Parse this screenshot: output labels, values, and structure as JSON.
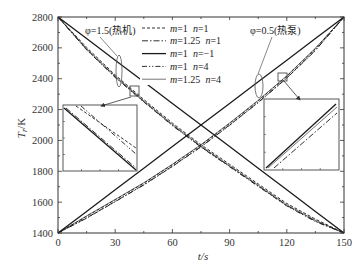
{
  "chart_data": {
    "type": "line",
    "title": "",
    "xlabel": "t/s",
    "ylabel": "T_r/K",
    "xlim": [
      0,
      150
    ],
    "ylim": [
      1400,
      2800
    ],
    "xticks": [
      0,
      30,
      60,
      90,
      120,
      150
    ],
    "yticks": [
      1400,
      1600,
      1800,
      2000,
      2200,
      2400,
      2600,
      2800
    ],
    "grid": false,
    "legend_position": "upper center",
    "x": [
      0,
      15,
      30,
      45,
      60,
      75,
      90,
      105,
      120,
      135,
      150
    ],
    "series": [
      {
        "name": "m=1 n=1",
        "group": "heat-engine phi=1.5",
        "style": "dashed",
        "values": [
          2800,
          2603,
          2424,
          2265,
          2112,
          1972,
          1845,
          1718,
          1591,
          1490,
          1400
        ]
      },
      {
        "name": "m=1.25 n=1",
        "group": "heat-engine phi=1.5",
        "style": "dash-dot",
        "values": [
          2800,
          2590,
          2411,
          2252,
          2099,
          1959,
          1832,
          1705,
          1578,
          1477,
          1400
        ]
      },
      {
        "name": "m=1 n=-1",
        "group": "heat-engine phi=1.5",
        "style": "solid",
        "values": [
          2800,
          2660,
          2520,
          2380,
          2240,
          2100,
          1960,
          1820,
          1680,
          1540,
          1400
        ]
      },
      {
        "name": "m=1 n=4",
        "group": "heat-engine phi=1.5",
        "style": "dash-dot-dot",
        "values": [
          2800,
          2587,
          2408,
          2249,
          2096,
          1956,
          1829,
          1702,
          1575,
          1474,
          1400
        ]
      },
      {
        "name": "m=1.25 n=4",
        "group": "heat-engine phi=1.5",
        "style": "thin-solid",
        "values": [
          2800,
          2595,
          2416,
          2257,
          2104,
          1964,
          1837,
          1710,
          1583,
          1482,
          1400
        ]
      },
      {
        "name": "m=1 n=1",
        "group": "heat-pump phi=0.5",
        "style": "dashed",
        "values": [
          1400,
          1508,
          1615,
          1723,
          1843,
          1970,
          2110,
          2257,
          2416,
          2595,
          2800
        ]
      },
      {
        "name": "m=1.25 n=1",
        "group": "heat-pump phi=0.5",
        "style": "dash-dot",
        "values": [
          1400,
          1498,
          1605,
          1713,
          1833,
          1960,
          2100,
          2247,
          2406,
          2585,
          2800
        ]
      },
      {
        "name": "m=1 n=-1",
        "group": "heat-pump phi=0.5",
        "style": "solid",
        "values": [
          1400,
          1540,
          1680,
          1820,
          1960,
          2100,
          2240,
          2380,
          2520,
          2660,
          2800
        ]
      },
      {
        "name": "m=1 n=4",
        "group": "heat-pump phi=0.5",
        "style": "dash-dot-dot",
        "values": [
          1400,
          1496,
          1603,
          1711,
          1831,
          1958,
          2098,
          2245,
          2404,
          2583,
          2800
        ]
      },
      {
        "name": "m=1.25 n=4",
        "group": "heat-pump phi=0.5",
        "style": "thin-solid",
        "values": [
          1400,
          1511,
          1618,
          1726,
          1846,
          1973,
          2113,
          2260,
          2419,
          2598,
          2800
        ]
      }
    ],
    "legend": [
      {
        "m": "1",
        "n": "1",
        "style": "dashed"
      },
      {
        "m": "1.25",
        "n": "1",
        "style": "dash-dot"
      },
      {
        "m": "1",
        "n": "−1",
        "style": "solid"
      },
      {
        "m": "1",
        "n": "4",
        "style": "dash-dot-dot"
      },
      {
        "m": "1.25",
        "n": "4",
        "style": "thin-solid"
      }
    ],
    "annotations": [
      {
        "text": "φ=1.5(热机)",
        "x": 85,
        "y": 34
      },
      {
        "text": "φ=0.5(热泵)",
        "x": 250,
        "y": 34
      }
    ],
    "insets": [
      {
        "name": "heat-engine-zoom",
        "box": [
          63,
          105,
          74,
          66
        ],
        "source_box": [
          130,
          86,
          9,
          10
        ],
        "arrow": [
          131,
          97,
          101,
          106
        ],
        "lines": [
          {
            "style": "solid",
            "pts": [
              64,
              108,
              136,
              170
            ]
          },
          {
            "style": "dash-dot",
            "pts": [
              66,
              108,
              136,
              168
            ]
          },
          {
            "style": "dashed",
            "pts": [
              76,
              106,
              136,
              148
            ]
          },
          {
            "style": "dash-dot-dot",
            "pts": [
              81,
              106,
              136,
              154
            ]
          }
        ]
      },
      {
        "name": "heat-pump-zoom",
        "box": [
          264,
          99,
          75,
          71
        ],
        "source_box": [
          278,
          73,
          9,
          8
        ],
        "arrow": [
          284,
          81,
          300,
          100
        ],
        "lines": [
          {
            "style": "solid",
            "pts": [
              266,
              168,
              336,
              104
            ]
          },
          {
            "style": "thin-solid",
            "pts": [
              268,
              168,
              337,
              107
            ]
          },
          {
            "style": "dash-dot",
            "pts": [
              274,
              168,
              337,
              113
            ]
          }
        ]
      }
    ],
    "ellipses": [
      {
        "cx": 119,
        "cy": 71,
        "rx": 3,
        "ry": 16,
        "leader": [
          100,
          37,
          117,
          56
        ]
      },
      {
        "cx": 259,
        "cy": 86,
        "rx": 4,
        "ry": 12,
        "leader": [
          272,
          37,
          258,
          74
        ]
      }
    ]
  }
}
